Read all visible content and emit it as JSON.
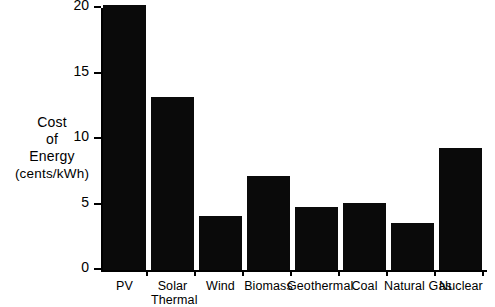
{
  "chart_data": {
    "type": "bar",
    "title": "",
    "xlabel": "",
    "ylabel": "Cost of Energy (cents/kWh)",
    "ylabel_lines": [
      "Cost",
      "of",
      "Energy",
      "(cents/kWh)"
    ],
    "categories": [
      "PV",
      "Solar Thermal",
      "Wind",
      "Biomass",
      "Geothermal",
      "Coal",
      "Natural Gas",
      "Nuclear"
    ],
    "category_label_lines": [
      [
        "PV"
      ],
      [
        "Solar",
        "Thermal"
      ],
      [
        "Wind"
      ],
      [
        "Biomass"
      ],
      [
        "Geothermal"
      ],
      [
        "Coal"
      ],
      [
        "Natural Gas"
      ],
      [
        "Nuclear"
      ]
    ],
    "values": [
      20.2,
      13.2,
      4.1,
      7.2,
      4.8,
      5.1,
      3.6,
      9.3
    ],
    "ylim": [
      0,
      20
    ],
    "yticks": [
      0,
      5,
      10,
      15,
      20
    ],
    "ytick_labels": [
      "0",
      "5",
      "10",
      "15",
      "20"
    ],
    "grid": false,
    "legend": "none",
    "bar_color": "#0a0a0a",
    "axis_color": "#000000",
    "background_color": "#ffffff"
  }
}
